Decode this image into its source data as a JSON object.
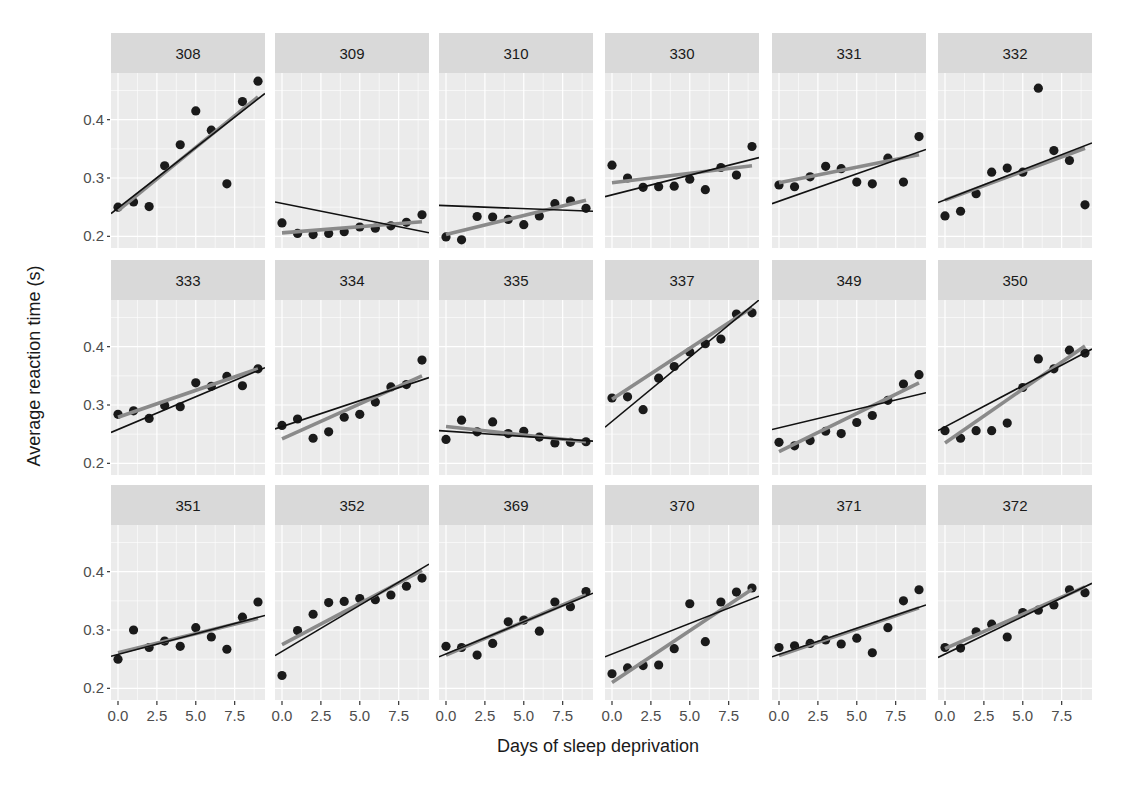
{
  "chart_data": {
    "type": "scatter",
    "layout": "facet_wrap",
    "facet_rows": 3,
    "facet_cols": 6,
    "title": "",
    "xlabel": "Days of sleep deprivation",
    "ylabel": "Average reaction time (s)",
    "xlim": [
      -0.45,
      9.45
    ],
    "ylim": [
      0.18,
      0.48
    ],
    "x_ticks": [
      0.0,
      2.5,
      5.0,
      7.5
    ],
    "x_tick_labels": [
      "0.0",
      "2.5",
      "5.0",
      "7.5"
    ],
    "y_ticks": [
      0.2,
      0.3,
      0.4
    ],
    "y_tick_labels": [
      "0.2",
      "0.3",
      "0.4"
    ],
    "grid": true,
    "legend": "none",
    "x": [
      0,
      1,
      2,
      3,
      4,
      5,
      6,
      7,
      8,
      9
    ],
    "line_legend": {
      "thick_gray": "per-subject linear fit",
      "thin_black": "model-predicted line"
    },
    "colors": {
      "panel_bg": "#ebebeb",
      "strip_bg": "#d9d9d9",
      "grid": "#ffffff",
      "points": "#1a1a1a",
      "subject_fit": "#8a8a8a",
      "model_fit": "#111111"
    },
    "panels": [
      {
        "subject": "308",
        "values": [
          0.25,
          0.259,
          0.251,
          0.321,
          0.357,
          0.415,
          0.382,
          0.29,
          0.431,
          0.466
        ],
        "fit": [
          0.244,
          0.439
        ],
        "model": [
          0.239,
          0.445
        ]
      },
      {
        "subject": "309",
        "values": [
          0.223,
          0.205,
          0.203,
          0.205,
          0.208,
          0.216,
          0.214,
          0.218,
          0.224,
          0.237
        ],
        "fit": [
          0.206,
          0.225
        ],
        "model": [
          0.259,
          0.206
        ]
      },
      {
        "subject": "310",
        "values": [
          0.199,
          0.194,
          0.234,
          0.233,
          0.229,
          0.22,
          0.235,
          0.256,
          0.261,
          0.248
        ],
        "fit": [
          0.203,
          0.262
        ],
        "model": [
          0.253,
          0.243
        ]
      },
      {
        "subject": "330",
        "values": [
          0.322,
          0.3,
          0.284,
          0.285,
          0.286,
          0.298,
          0.28,
          0.318,
          0.305,
          0.354
        ],
        "fit": [
          0.292,
          0.321
        ],
        "model": [
          0.268,
          0.335
        ]
      },
      {
        "subject": "331",
        "values": [
          0.288,
          0.285,
          0.302,
          0.32,
          0.316,
          0.293,
          0.29,
          0.334,
          0.293,
          0.371
        ],
        "fit": [
          0.292,
          0.34
        ],
        "model": [
          0.256,
          0.349
        ]
      },
      {
        "subject": "332",
        "values": [
          0.235,
          0.243,
          0.273,
          0.31,
          0.317,
          0.31,
          0.454,
          0.347,
          0.33,
          0.254
        ],
        "fit": [
          0.262,
          0.351
        ],
        "model": [
          0.258,
          0.36
        ]
      },
      {
        "subject": "333",
        "values": [
          0.284,
          0.29,
          0.277,
          0.299,
          0.297,
          0.338,
          0.332,
          0.349,
          0.333,
          0.362
        ],
        "fit": [
          0.279,
          0.362
        ],
        "model": [
          0.253,
          0.364
        ]
      },
      {
        "subject": "334",
        "values": [
          0.265,
          0.276,
          0.243,
          0.254,
          0.279,
          0.284,
          0.305,
          0.331,
          0.335,
          0.377
        ],
        "fit": [
          0.242,
          0.35
        ],
        "model": [
          0.259,
          0.347
        ]
      },
      {
        "subject": "335",
        "values": [
          0.241,
          0.274,
          0.254,
          0.271,
          0.251,
          0.255,
          0.245,
          0.235,
          0.236,
          0.237
        ],
        "fit": [
          0.263,
          0.237
        ],
        "model": [
          0.256,
          0.238
        ]
      },
      {
        "subject": "337",
        "values": [
          0.312,
          0.314,
          0.292,
          0.346,
          0.366,
          0.391,
          0.405,
          0.413,
          0.456,
          0.458
        ],
        "fit": [
          0.31,
          0.467
        ],
        "model": [
          0.262,
          0.48
        ]
      },
      {
        "subject": "349",
        "values": [
          0.236,
          0.23,
          0.239,
          0.255,
          0.251,
          0.27,
          0.282,
          0.308,
          0.336,
          0.352
        ],
        "fit": [
          0.22,
          0.338
        ],
        "model": [
          0.258,
          0.321
        ]
      },
      {
        "subject": "350",
        "values": [
          0.256,
          0.243,
          0.256,
          0.256,
          0.269,
          0.33,
          0.379,
          0.362,
          0.394,
          0.389
        ],
        "fit": [
          0.235,
          0.401
        ],
        "model": [
          0.256,
          0.396
        ]
      },
      {
        "subject": "351",
        "values": [
          0.25,
          0.3,
          0.27,
          0.281,
          0.272,
          0.304,
          0.288,
          0.267,
          0.322,
          0.348
        ],
        "fit": [
          0.261,
          0.32
        ],
        "model": [
          0.255,
          0.325
        ]
      },
      {
        "subject": "352",
        "values": [
          0.222,
          0.299,
          0.327,
          0.347,
          0.349,
          0.354,
          0.352,
          0.36,
          0.375,
          0.389
        ],
        "fit": [
          0.275,
          0.402
        ],
        "model": [
          0.256,
          0.413
        ]
      },
      {
        "subject": "369",
        "values": [
          0.272,
          0.27,
          0.257,
          0.277,
          0.314,
          0.317,
          0.298,
          0.348,
          0.34,
          0.366
        ],
        "fit": [
          0.257,
          0.36
        ],
        "model": [
          0.254,
          0.363
        ]
      },
      {
        "subject": "370",
        "values": [
          0.225,
          0.235,
          0.239,
          0.24,
          0.268,
          0.345,
          0.28,
          0.348,
          0.365,
          0.372
        ],
        "fit": [
          0.21,
          0.37
        ],
        "model": [
          0.254,
          0.358
        ]
      },
      {
        "subject": "371",
        "values": [
          0.27,
          0.273,
          0.277,
          0.283,
          0.276,
          0.286,
          0.261,
          0.304,
          0.35,
          0.369
        ],
        "fit": [
          0.256,
          0.338
        ],
        "model": [
          0.254,
          0.343
        ]
      },
      {
        "subject": "372",
        "values": [
          0.27,
          0.269,
          0.297,
          0.31,
          0.288,
          0.33,
          0.334,
          0.343,
          0.369,
          0.364
        ],
        "fit": [
          0.268,
          0.374
        ],
        "model": [
          0.253,
          0.38
        ]
      }
    ]
  }
}
